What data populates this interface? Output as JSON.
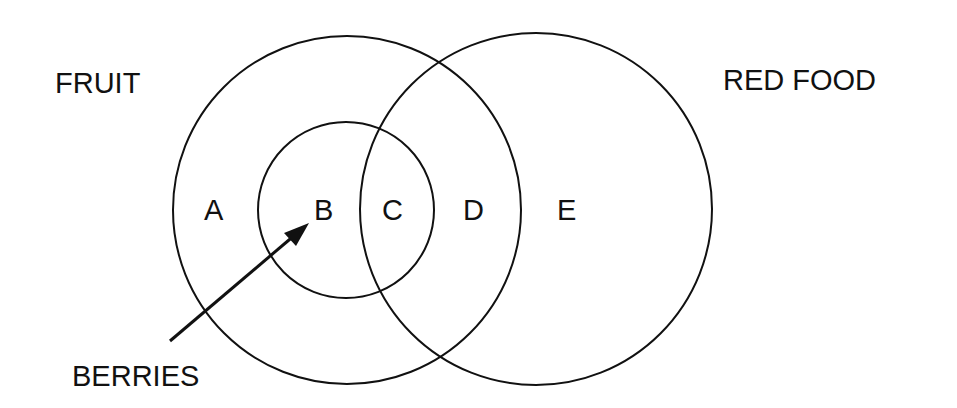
{
  "diagram": {
    "type": "venn",
    "sets": [
      {
        "id": "fruit",
        "label": "FRUIT"
      },
      {
        "id": "berries",
        "label": "BERRIES",
        "subset_of": "fruit"
      },
      {
        "id": "red_food",
        "label": "RED FOOD"
      }
    ],
    "regions": [
      {
        "label": "A",
        "description": "fruit, not berries, not red food"
      },
      {
        "label": "B",
        "description": "berries, not red food"
      },
      {
        "label": "C",
        "description": "berries and red food"
      },
      {
        "label": "D",
        "description": "fruit (non-berry) and red food"
      },
      {
        "label": "E",
        "description": "red food, not fruit"
      }
    ],
    "colors": {
      "stroke": "#111111",
      "background": "#ffffff"
    }
  },
  "labels": {
    "fruit": "FRUIT",
    "red_food": "RED FOOD",
    "berries": "BERRIES",
    "region_a": "A",
    "region_b": "B",
    "region_c": "C",
    "region_d": "D",
    "region_e": "E"
  }
}
